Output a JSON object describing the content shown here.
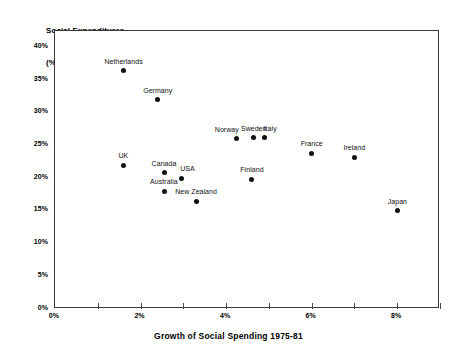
{
  "title": {
    "line1": "Social Expenditures",
    "line2": "(% GDP) 1975"
  },
  "xaxis_caption": "Growth of Social Spending 1975-81",
  "chart_data": {
    "type": "scatter",
    "title": "Social Expenditures (% GDP) 1975",
    "xlabel": "Growth of Social Spending 1975-81",
    "ylabel": "Social Expenditures (% GDP) 1975",
    "xlim": [
      0,
      9
    ],
    "ylim": [
      0,
      42.5
    ],
    "grid": false,
    "legend": "none",
    "xticks": [
      0,
      1,
      2,
      3,
      4,
      5,
      6,
      7,
      8,
      9
    ],
    "xtick_labels": [
      "0%",
      "",
      "2%",
      "",
      "4%",
      "",
      "6%",
      "",
      "8%",
      ""
    ],
    "yticks": [
      0,
      5,
      10,
      15,
      20,
      25,
      30,
      35,
      40
    ],
    "ytick_labels": [
      "0%",
      "5%",
      "10%",
      "15%",
      "20%",
      "25%",
      "30%",
      "35%",
      "40%"
    ],
    "points": [
      {
        "label": "Netherlands",
        "x": 1.6,
        "y": 36.4,
        "label_pos": "above"
      },
      {
        "label": "Germany",
        "x": 2.4,
        "y": 32.0,
        "label_pos": "above"
      },
      {
        "label": "Norway",
        "x": 4.25,
        "y": 26.0,
        "label_pos": "above-left"
      },
      {
        "label": "Sweden",
        "x": 4.65,
        "y": 26.2,
        "label_pos": "above"
      },
      {
        "label": "Italy",
        "x": 4.9,
        "y": 26.2,
        "label_pos": "above-right"
      },
      {
        "label": "France",
        "x": 6.0,
        "y": 23.8,
        "label_pos": "above"
      },
      {
        "label": "Ireland",
        "x": 7.0,
        "y": 23.2,
        "label_pos": "above"
      },
      {
        "label": "UK",
        "x": 1.6,
        "y": 22.0,
        "label_pos": "above"
      },
      {
        "label": "Canada",
        "x": 2.55,
        "y": 20.8,
        "label_pos": "above"
      },
      {
        "label": "USA",
        "x": 2.95,
        "y": 20.0,
        "label_pos": "above-right"
      },
      {
        "label": "Finland",
        "x": 4.6,
        "y": 19.8,
        "label_pos": "above"
      },
      {
        "label": "Australia",
        "x": 2.55,
        "y": 18.0,
        "label_pos": "above"
      },
      {
        "label": "New Zealand",
        "x": 3.3,
        "y": 16.5,
        "label_pos": "above"
      },
      {
        "label": "Japan",
        "x": 8.0,
        "y": 15.0,
        "label_pos": "above"
      }
    ]
  }
}
